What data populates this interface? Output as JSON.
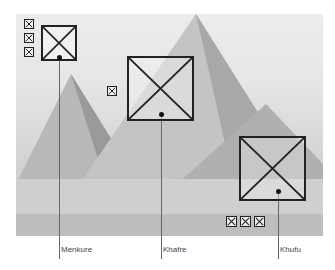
{
  "figure": {
    "photo_alt": "Pyramids of Giza",
    "pyramids": [
      {
        "name": "Menkure",
        "label": "Menkure",
        "queens_pyramids": 3
      },
      {
        "name": "Khafre",
        "label": "Khafre",
        "queens_pyramids": 1
      },
      {
        "name": "Khufu",
        "label": "Khufu",
        "queens_pyramids": 3
      }
    ]
  }
}
